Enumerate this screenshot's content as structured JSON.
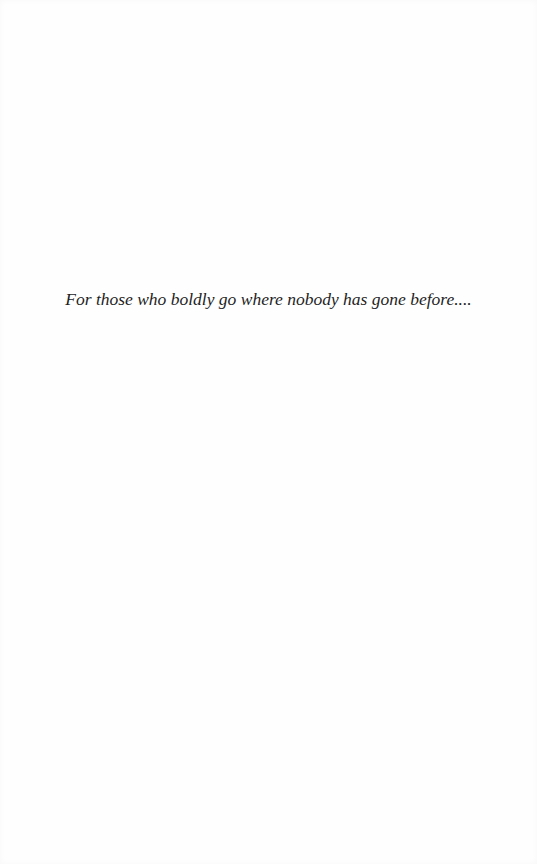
{
  "page": {
    "type": "dedication",
    "text": "For those who boldly go where nobody has gone before...."
  }
}
